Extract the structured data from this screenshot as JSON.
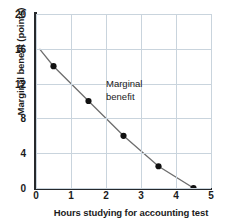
{
  "chart_data": {
    "type": "line",
    "title": "",
    "xlabel": "Hours studying for accounting test",
    "ylabel": "Marginal benefit  (points)",
    "xlim": [
      0,
      5
    ],
    "ylim": [
      0,
      20
    ],
    "xticks": [
      "0",
      "1",
      "2",
      "3",
      "4",
      "5"
    ],
    "xtick_values": [
      0,
      1,
      2,
      3,
      4,
      5
    ],
    "yticks": [
      "0",
      "4",
      "8",
      "12",
      "16",
      "20"
    ],
    "ytick_values": [
      0,
      4,
      8,
      12,
      16,
      20
    ],
    "grid": true,
    "legend": "none",
    "series": [
      {
        "name": "Marginal benefit",
        "x": [
          0.5,
          1.5,
          2.5,
          3.5,
          4.5
        ],
        "values": [
          14,
          10,
          6,
          2.5,
          0
        ],
        "line_start": [
          0.1,
          16
        ],
        "line_color": "#6e6e6e",
        "marker_color": "#111111",
        "marker": "circle"
      }
    ],
    "annotations": [
      {
        "text": "Marginal\nbenefit",
        "x": 2.0,
        "y": 12.6
      }
    ]
  },
  "style": {
    "grid_color": "#c9d4dd",
    "axis_color": "#26292c",
    "text_color": "#1b1b1b",
    "background": "#ffffff"
  }
}
